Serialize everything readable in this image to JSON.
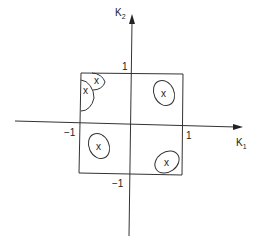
{
  "diagram": {
    "axes": {
      "x_label": "K",
      "x_label_sub": "1",
      "y_label": "K",
      "y_label_sub": "2"
    },
    "ticks": {
      "x_pos": "1",
      "x_neg": "−1",
      "y_pos": "1",
      "y_neg": "−1"
    },
    "region": "unit square, corners at (±1, ±1)",
    "markers": [
      {
        "label": "x",
        "quadrant": "upper-left corner (inner)"
      },
      {
        "label": "x",
        "quadrant": "upper-left corner (outer)"
      },
      {
        "label": "x",
        "quadrant": "upper-right"
      },
      {
        "label": "x",
        "quadrant": "lower-left"
      },
      {
        "label": "x",
        "quadrant": "lower-right"
      }
    ],
    "colors": {
      "line": "#333333",
      "background": "#ffffff"
    }
  }
}
